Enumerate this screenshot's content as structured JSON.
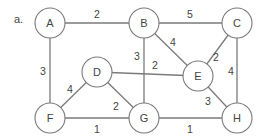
{
  "figure": {
    "label": "a."
  },
  "graph": {
    "nodes": [
      {
        "id": "A",
        "x": 50,
        "y": 23
      },
      {
        "id": "B",
        "x": 144,
        "y": 23
      },
      {
        "id": "C",
        "x": 237,
        "y": 23
      },
      {
        "id": "D",
        "x": 97,
        "y": 72
      },
      {
        "id": "E",
        "x": 198,
        "y": 76
      },
      {
        "id": "F",
        "x": 50,
        "y": 118
      },
      {
        "id": "G",
        "x": 144,
        "y": 118
      },
      {
        "id": "H",
        "x": 237,
        "y": 118
      }
    ],
    "edges": [
      {
        "from": "A",
        "to": "B",
        "weight": "2",
        "lx": 97,
        "ly": 14
      },
      {
        "from": "B",
        "to": "C",
        "weight": "5",
        "lx": 190,
        "ly": 14
      },
      {
        "from": "A",
        "to": "F",
        "weight": "3",
        "lx": 43,
        "ly": 71
      },
      {
        "from": "B",
        "to": "E",
        "weight": "4",
        "lx": 173,
        "ly": 42
      },
      {
        "from": "B",
        "to": "G",
        "weight": "3",
        "lx": 137,
        "ly": 56
      },
      {
        "from": "C",
        "to": "E",
        "weight": "2",
        "lx": 216,
        "ly": 57
      },
      {
        "from": "C",
        "to": "H",
        "weight": "4",
        "lx": 231,
        "ly": 71
      },
      {
        "from": "D",
        "to": "E",
        "weight": "2",
        "lx": 155,
        "ly": 65
      },
      {
        "from": "D",
        "to": "F",
        "weight": "4",
        "lx": 70,
        "ly": 89
      },
      {
        "from": "D",
        "to": "G",
        "weight": "2",
        "lx": 116,
        "ly": 106
      },
      {
        "from": "E",
        "to": "H",
        "weight": "3",
        "lx": 208,
        "ly": 101
      },
      {
        "from": "F",
        "to": "G",
        "weight": "1",
        "lx": 97,
        "ly": 129
      },
      {
        "from": "G",
        "to": "H",
        "weight": "1",
        "lx": 190,
        "ly": 129
      }
    ]
  }
}
